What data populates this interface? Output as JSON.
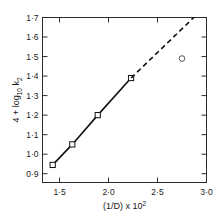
{
  "chart_data": {
    "type": "scatter",
    "title": "",
    "xlabel": "(1/D) x 10",
    "xlabel_exponent": "2",
    "ylabel_prefix": "4 + log",
    "ylabel_sub": "10",
    "ylabel_var": " k",
    "ylabel_var_sub": "2",
    "ylabel_full": "4 + log10 k2",
    "xlim": [
      1.326,
      3.0
    ],
    "ylim": [
      0.855,
      1.7
    ],
    "grid": false,
    "legend": null,
    "x_ticks": [
      1.5,
      2.0,
      2.5,
      3.0
    ],
    "x_tick_labels": [
      "1·5",
      "2·0",
      "2·5",
      "3·0"
    ],
    "y_ticks": [
      0.9,
      1.0,
      1.1,
      1.2,
      1.3,
      1.4,
      1.5,
      1.6,
      1.7
    ],
    "y_tick_labels": [
      "0·9",
      "1·0",
      "1·1",
      "1·2",
      "1·3",
      "1·4",
      "1·5",
      "1·6",
      "1·7"
    ],
    "series": [
      {
        "name": "fitted-data",
        "marker": "open-square",
        "line": "solid",
        "x": [
          1.43,
          1.63,
          1.89,
          2.23
        ],
        "y": [
          0.945,
          1.05,
          1.2,
          1.39
        ]
      },
      {
        "name": "extrapolation",
        "marker": "none",
        "line": "dashed",
        "x": [
          2.23,
          2.87
        ],
        "y": [
          1.39,
          1.7
        ]
      },
      {
        "name": "outlier-point",
        "marker": "open-circle",
        "line": "none",
        "x": [
          2.75
        ],
        "y": [
          1.49
        ]
      }
    ],
    "colors": {
      "line": "#111111",
      "frame": "#2b2b2b",
      "background": "#ffffff",
      "marker_fill": "#ffffff"
    }
  }
}
